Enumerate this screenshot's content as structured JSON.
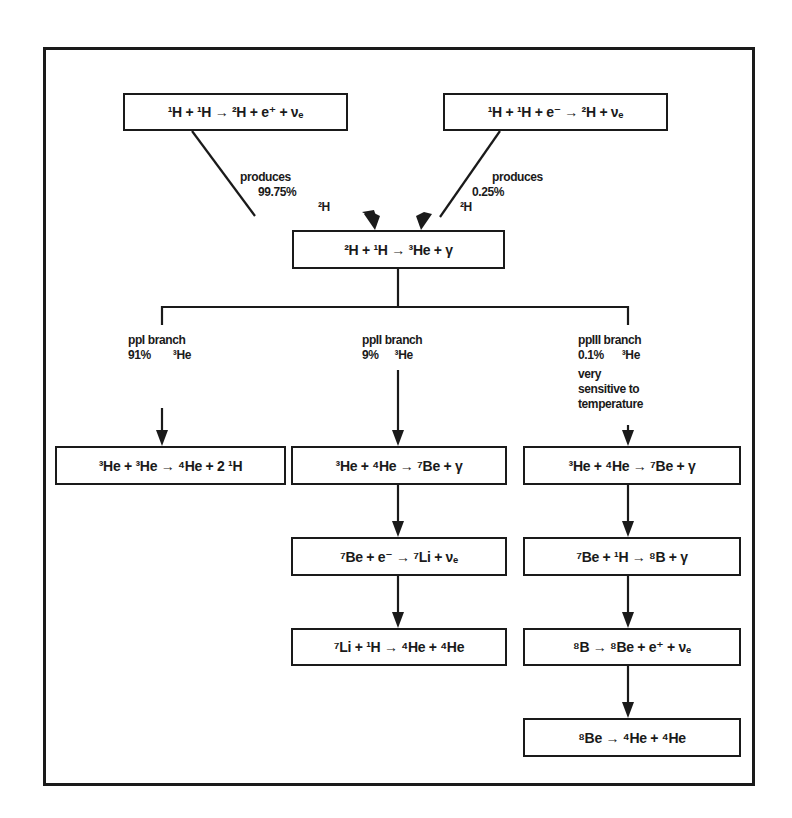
{
  "diagram": {
    "top_reactions": {
      "pp": {
        "parts": [
          "1|H",
          " + ",
          "1|H",
          " → ",
          "2|H",
          " + e",
          "+|",
          " + ν",
          "_e"
        ],
        "text": "¹H + ¹H → ²H + e⁺ + νₑ"
      },
      "pep": {
        "text": "¹H + ¹H + e⁻ → ²H + νₑ"
      }
    },
    "arrow_labels": {
      "left": {
        "line1": "produces",
        "line2": "99.75%",
        "product": "²H"
      },
      "right": {
        "line1": "produces",
        "line2": "0.25%",
        "product": "²H"
      }
    },
    "center_reaction": {
      "text": "²H + ¹H → ³He + γ"
    },
    "branches": [
      {
        "name": "ppI branch",
        "percent": "91%",
        "product": "³He",
        "note": [],
        "reactions": [
          {
            "text": "³He + ³He → ⁴He + 2 ¹H"
          }
        ]
      },
      {
        "name": "ppII branch",
        "percent": "9%",
        "product": "³He",
        "note": [],
        "reactions": [
          {
            "text": "³He + ⁴He → ⁷Be + γ"
          },
          {
            "text": "⁷Be + e⁻ → ⁷Li + νₑ"
          },
          {
            "text": "⁷Li + ¹H → ⁴He + ⁴He"
          }
        ]
      },
      {
        "name": "ppIII branch",
        "percent": "0.1%",
        "product": "³He",
        "note": [
          "very",
          "sensitive to",
          "temperature"
        ],
        "reactions": [
          {
            "text": "³He + ⁴He → ⁷Be + γ"
          },
          {
            "text": "⁷Be + ¹H → ⁸B + γ"
          },
          {
            "text": "⁸B → ⁸Be + e⁺ + νₑ"
          },
          {
            "text": "⁸Be → ⁴He + ⁴He"
          }
        ]
      }
    ],
    "colors": {
      "ink": "#1a1a1a",
      "background": "#ffffff"
    }
  }
}
